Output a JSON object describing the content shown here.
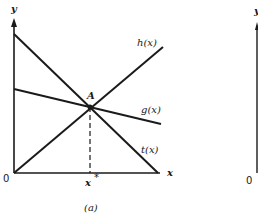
{
  "figure": {
    "caption": "(a)",
    "colors": {
      "ink": "#1a1a1a",
      "background": "#ffffff"
    },
    "axes": {
      "y_label": "y",
      "x_label": "x",
      "origin_label": "0"
    },
    "curves": [
      {
        "name": "h",
        "label": "h(x)"
      },
      {
        "name": "g",
        "label": "g(x)"
      },
      {
        "name": "t",
        "label": "t(x)"
      }
    ],
    "intersection": {
      "label": "A"
    },
    "x_star_label": "x",
    "x_star_superscript": "*",
    "second_panel": {
      "y_label": "y",
      "origin_label": "0"
    }
  }
}
